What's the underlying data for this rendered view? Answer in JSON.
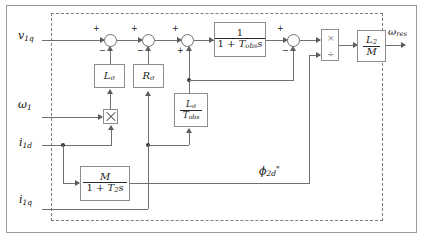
{
  "diagram": {
    "boundary_style": "dashed",
    "inputs": [
      {
        "name": "input-v1q",
        "label_html": "v<sub>1q</sub>",
        "label_text": "v1q"
      },
      {
        "name": "input-omega1",
        "label_html": "ω<sub>1</sub>",
        "label_text": "ω1"
      },
      {
        "name": "input-i1d",
        "label_html": "i<sub>1d</sub>",
        "label_text": "i1d"
      },
      {
        "name": "input-i1q",
        "label_html": "i<sub>1q</sub>",
        "label_text": "i1q"
      }
    ],
    "outputs": [
      {
        "name": "output-omega-res",
        "label_text": "ωres"
      }
    ],
    "internal_signals": [
      {
        "name": "signal-phi2d-ref",
        "label_text": "φ2d*"
      }
    ],
    "blocks": [
      {
        "id": "block-l-sigma",
        "type": "gain",
        "label_text": "Lσ"
      },
      {
        "id": "block-r-sigma",
        "type": "gain",
        "label_text": "Rσ"
      },
      {
        "id": "block-l-sigma-t-obs",
        "type": "gain-fraction",
        "numerator": "Lσ",
        "denominator": "Tobs"
      },
      {
        "id": "block-obs-lag",
        "type": "transfer-function",
        "numerator": "1",
        "denominator": "1 + Tobs s"
      },
      {
        "id": "block-rotor-flux",
        "type": "transfer-function",
        "numerator": "M",
        "denominator": "1 + T2 s"
      },
      {
        "id": "block-l2-over-m",
        "type": "gain-fraction",
        "numerator": "L2",
        "denominator": "M"
      },
      {
        "id": "block-multiplier",
        "type": "multiplier",
        "label_text": "×"
      },
      {
        "id": "block-product-divide",
        "type": "product-divide",
        "top_op": "×",
        "bottom_op": "÷"
      }
    ],
    "summers": [
      {
        "id": "summer-1",
        "left_sign": "+",
        "bottom_sign": "−"
      },
      {
        "id": "summer-2",
        "left_sign": "+",
        "bottom_sign": "−"
      },
      {
        "id": "summer-3",
        "left_sign": "+",
        "bottom_sign": "+"
      },
      {
        "id": "summer-4",
        "left_sign": "+",
        "bottom_sign": "−"
      }
    ],
    "colors": {
      "wire": "#6f6f6f",
      "block_border": "#8d8d8d",
      "boundary": "#7d7d7d",
      "frame": "#9a9a9a",
      "text": "#1d1d1d",
      "background": "#ffffff"
    }
  }
}
